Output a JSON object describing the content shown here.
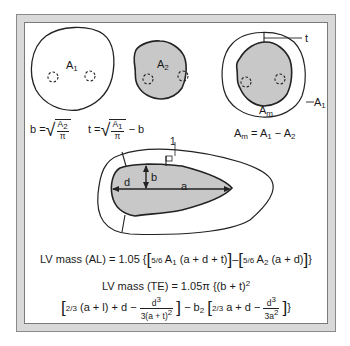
{
  "diagram": {
    "colors": {
      "frame_border": "#d9d9d9",
      "panel_background": "#ffffff",
      "cavity_fill": "#c8c8c8",
      "stroke": "#222222"
    },
    "views": [
      {
        "id": "epicardial-area",
        "labels": {
          "area": "A",
          "area_sub": "1"
        },
        "description": "Epicardial outline with papillary muscles (dashed)"
      },
      {
        "id": "endocardial-area",
        "labels": {
          "area": "A",
          "area_sub": "2"
        },
        "description": "Endocardial cavity (shaded) with papillary muscles"
      },
      {
        "id": "myocardial-area",
        "labels": {
          "thickness": "t",
          "outer": "A",
          "outer_sub": "1",
          "myocardium": "A",
          "myocardium_sub": "m"
        },
        "formula": {
          "lhs": "A",
          "lhs_sub": "m",
          "eq": " = A",
          "a1_sub": "1",
          "minus": " − A",
          "a2_sub": "2"
        }
      }
    ],
    "formulas": {
      "b": {
        "lhs": "b =",
        "num": "A",
        "num_sub": "2",
        "den": "π"
      },
      "t": {
        "lhs": "t =",
        "num": "A",
        "num_sub": "1",
        "den": "π",
        "tail": "− b"
      }
    },
    "long_axis": {
      "labels": {
        "d": "d",
        "b": "b",
        "a": "a",
        "t": "1"
      }
    },
    "equations": {
      "al": {
        "lhs": "LV mass (AL) = 1.05 {",
        "frac1": "5/6",
        "term1a": " A",
        "term1a_sub": "1",
        "term1b": " (a + d + t)",
        "mid": "–",
        "frac2": "5/6",
        "term2a": " A",
        "term2a_sub": "2",
        "term2b": " (a + d)",
        "close": "}"
      },
      "te": {
        "line1": "LV mass (TE) = 1.05π {(b + t)",
        "line1_sup": "2",
        "l2_frac1": "2/3",
        "l2_a": " (a + l) + d −",
        "l2_num1": "d",
        "l2_num1_sup": "3",
        "l2_den1": "3(a + t)",
        "l2_den1_sup": "2",
        "l2_mid": "− b",
        "l2_mid_sub": "2",
        "l2_frac2": "2/3",
        "l2_b": " a + d −",
        "l2_num2": "d",
        "l2_num2_sup": "3",
        "l2_den2": "3a",
        "l2_den2_sup": "2",
        "close": "}"
      }
    }
  }
}
